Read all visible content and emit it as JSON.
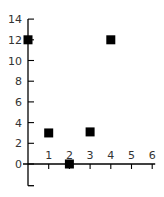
{
  "chart_data": {
    "type": "scatter",
    "title": "",
    "xlabel": "",
    "ylabel": "",
    "xlim": [
      0,
      6
    ],
    "ylim": [
      -2,
      14
    ],
    "x_ticks": [
      1,
      2,
      3,
      4,
      5,
      6
    ],
    "y_ticks": [
      0,
      2,
      4,
      6,
      8,
      10,
      12,
      14
    ],
    "grid": false,
    "legend": null,
    "marker": "square",
    "marker_color": "#000000",
    "series": [
      {
        "name": "points",
        "points": [
          {
            "x": 0,
            "y": 12
          },
          {
            "x": 1,
            "y": 3
          },
          {
            "x": 2,
            "y": 0
          },
          {
            "x": 3,
            "y": 3.1
          },
          {
            "x": 4,
            "y": 12
          }
        ]
      }
    ]
  },
  "colors": {
    "axis": "#000000",
    "tick_label": "#333333",
    "marker": "#000000",
    "background": "#ffffff"
  }
}
